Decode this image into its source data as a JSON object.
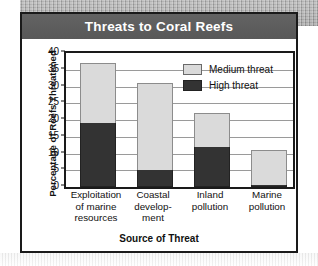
{
  "chart_data": {
    "type": "bar",
    "subtype": "stacked-bar",
    "title": "Threats to Coral Reefs",
    "xlabel": "Source of Threat",
    "ylabel": "Percentage of Reefs Threatened",
    "categories": [
      "Exploitation of marine resources",
      "Coastal develop- ment",
      "Inland pollution",
      "Marine pollution"
    ],
    "category_lines": [
      [
        "Exploitation",
        "of marine",
        "resources"
      ],
      [
        "Coastal",
        "develop-",
        "ment"
      ],
      [
        "Inland",
        "pollution"
      ],
      [
        "Marine",
        "pollution"
      ]
    ],
    "series": [
      {
        "name": "High threat",
        "color": "#333333",
        "values": [
          19,
          5,
          12,
          0.5
        ]
      },
      {
        "name": "Medium threat",
        "color": "#dadada",
        "values": [
          18,
          26,
          10,
          10.5
        ]
      }
    ],
    "totals": [
      37,
      31,
      22,
      11
    ],
    "ylim": [
      0,
      40
    ],
    "ytick_values": [
      0,
      5,
      10,
      15,
      20,
      25,
      30,
      35,
      40
    ],
    "ytick_labels": [
      "0",
      "5",
      "10",
      "15",
      "20",
      "25",
      "30",
      "35",
      "40"
    ],
    "grid": true,
    "legend_position": "upper-right-inside",
    "legend": [
      "Medium threat",
      "High threat"
    ]
  },
  "legend_entries": [
    {
      "label": "Medium threat",
      "swatch": "medium"
    },
    {
      "label": "High threat",
      "swatch": "high"
    }
  ],
  "colors": {
    "high_threat": "#333333",
    "medium_threat": "#dadada",
    "title_band": "#5c5c5c",
    "frame": "#1a1a1a",
    "gridline": "#9a9a9a",
    "title_text": "#ffffff"
  }
}
